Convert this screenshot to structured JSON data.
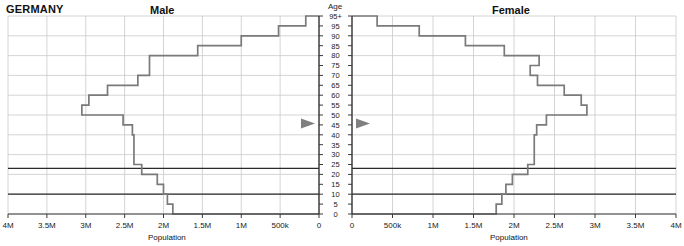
{
  "header": {
    "country": "GERMANY",
    "male_title": "Male",
    "female_title": "Female",
    "age_axis_title": "Age"
  },
  "axes": {
    "xlabel_left": "Population",
    "xlabel_right": "Population",
    "left_ticks": [
      "4M",
      "3.5M",
      "3M",
      "2.5M",
      "2M",
      "1.5M",
      "1M",
      "500k",
      "0"
    ],
    "right_ticks": [
      "0",
      "500k",
      "1M",
      "1.5M",
      "2M",
      "2.5M",
      "3M",
      "3.5M",
      "4M"
    ],
    "age_ticks": [
      "95+",
      "95",
      "90",
      "85",
      "80",
      "75",
      "70",
      "65",
      "60",
      "55",
      "50",
      "45",
      "40",
      "35",
      "30",
      "25",
      "20",
      "15",
      "10",
      "5",
      "0"
    ]
  },
  "markers": {
    "median_age_marker_label": "45",
    "marker_color": "#808080",
    "rule_ages": [
      23,
      10
    ]
  },
  "colors": {
    "line": "#7a7a7a",
    "grid": "#c9c9c9",
    "axis": "#3a3a3a",
    "rule": "#2a2a2a"
  },
  "chart_data": {
    "type": "bar",
    "title": "GERMANY",
    "subtitle": "Population pyramid",
    "xlabel": "Population",
    "ylabel": "Age",
    "xlim": [
      0,
      4000000
    ],
    "ylim": [
      0,
      100
    ],
    "grid": true,
    "legend": "none",
    "orientation": "horizontal-pyramid",
    "age_groups": [
      "0-4",
      "5-9",
      "10-14",
      "15-19",
      "20-24",
      "25-29",
      "30-34",
      "35-39",
      "40-44",
      "45-49",
      "50-54",
      "55-59",
      "60-64",
      "65-69",
      "70-74",
      "75-79",
      "80-84",
      "85-89",
      "90-94",
      "95+"
    ],
    "series": [
      {
        "name": "Male",
        "side": "left",
        "values": [
          1880000,
          1950000,
          2000000,
          2080000,
          2280000,
          2380000,
          2380000,
          2380000,
          2400000,
          2520000,
          3050000,
          2960000,
          2720000,
          2330000,
          2180000,
          2180000,
          1560000,
          1000000,
          520000,
          170000
        ]
      },
      {
        "name": "Female",
        "side": "right",
        "values": [
          1780000,
          1850000,
          1900000,
          1980000,
          2170000,
          2250000,
          2250000,
          2250000,
          2280000,
          2400000,
          2900000,
          2830000,
          2620000,
          2290000,
          2200000,
          2310000,
          1880000,
          1400000,
          830000,
          310000
        ]
      }
    ]
  }
}
